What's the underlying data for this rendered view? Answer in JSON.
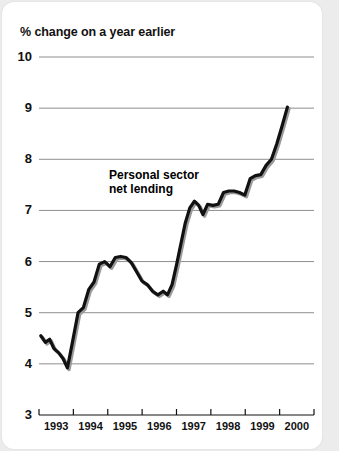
{
  "chart_data": {
    "type": "line",
    "title": "% change on a year earlier",
    "xlabel": "",
    "ylabel": "% change on a year earlier",
    "ylim": [
      3,
      10
    ],
    "xlim": [
      1993,
      2000.75
    ],
    "grid": true,
    "legend_position": "inline-annotation",
    "yticks": [
      10,
      9,
      8,
      7,
      6,
      5,
      4,
      3
    ],
    "ytick_labels": [
      "10",
      "9",
      "8",
      "7",
      "6",
      "5",
      "4",
      "3"
    ],
    "xticks": [
      1993,
      1994,
      1995,
      1996,
      1997,
      1998,
      1999,
      2000
    ],
    "xtick_labels": [
      "1993",
      "1994",
      "1995",
      "1996",
      "1997",
      "1998",
      "1999",
      "2000"
    ],
    "annotations": [
      {
        "text": "Personal sector\nnet lending",
        "x": 1995.2,
        "y": 7.55
      }
    ],
    "series": [
      {
        "name": "Personal sector net lending",
        "color": "#111111",
        "x": [
          1993.05,
          1993.18,
          1993.3,
          1993.42,
          1993.55,
          1993.68,
          1993.8,
          1993.95,
          1994.1,
          1994.25,
          1994.4,
          1994.55,
          1994.7,
          1994.85,
          1995.0,
          1995.15,
          1995.3,
          1995.45,
          1995.6,
          1995.75,
          1995.9,
          1996.05,
          1996.2,
          1996.35,
          1996.5,
          1996.62,
          1996.75,
          1996.88,
          1997.0,
          1997.12,
          1997.25,
          1997.38,
          1997.5,
          1997.62,
          1997.75,
          1997.9,
          1998.05,
          1998.2,
          1998.35,
          1998.5,
          1998.65,
          1998.8,
          1998.95,
          1999.1,
          1999.25,
          1999.4,
          1999.55,
          1999.7,
          1999.85,
          2000.0
        ],
        "y": [
          4.55,
          4.42,
          4.48,
          4.3,
          4.22,
          4.1,
          3.92,
          4.45,
          5.0,
          5.1,
          5.45,
          5.6,
          5.95,
          6.0,
          5.9,
          6.08,
          6.1,
          6.08,
          5.98,
          5.8,
          5.62,
          5.55,
          5.42,
          5.35,
          5.42,
          5.35,
          5.55,
          5.95,
          6.35,
          6.75,
          7.05,
          7.18,
          7.1,
          6.92,
          7.12,
          7.1,
          7.12,
          7.35,
          7.38,
          7.38,
          7.35,
          7.3,
          7.62,
          7.68,
          7.7,
          7.88,
          8.0,
          8.3,
          8.65,
          9.02
        ]
      }
    ]
  },
  "card": {
    "title": "% change on a year earlier",
    "annotation_line1": "Personal sector",
    "annotation_line2": "net lending"
  }
}
